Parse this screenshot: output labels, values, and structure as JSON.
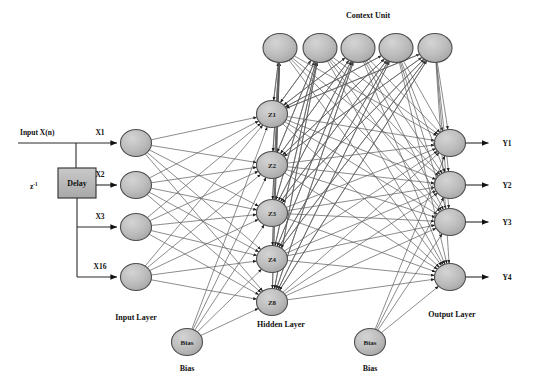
{
  "figure": {
    "background_color": "#ffffff",
    "node_fill": "#b6b6b6",
    "node_stroke": "#4d4d4d",
    "edge_color": "#5a5a5a",
    "text_color": "#111111"
  },
  "captions": {
    "context_unit": "Context Unit",
    "input_layer": "Input Layer",
    "hidden_layer": "Hidden Layer",
    "output_layer": "Output Layer",
    "bias_left": "Bias",
    "bias_right": "Bias"
  },
  "input_signal": {
    "source_label": "Input X(n)",
    "delay_label": "Delay",
    "delay_operator": "z",
    "delay_exponent": "-1"
  },
  "layers": {
    "input": {
      "count": 4,
      "nodes": [
        {
          "label": "",
          "signal_label": "X1",
          "cx": 136,
          "cy": 143
        },
        {
          "label": "",
          "signal_label": "X2",
          "cx": 136,
          "cy": 185
        },
        {
          "label": "",
          "signal_label": "X3",
          "cx": 136,
          "cy": 227
        },
        {
          "label": "",
          "signal_label": "X16",
          "cx": 136,
          "cy": 277
        }
      ]
    },
    "hidden": {
      "count": 5,
      "nodes": [
        {
          "label": "Z1",
          "cx": 272,
          "cy": 114
        },
        {
          "label": "Z2",
          "cx": 272,
          "cy": 165
        },
        {
          "label": "Z3",
          "cx": 272,
          "cy": 213
        },
        {
          "label": "Z4",
          "cx": 272,
          "cy": 259
        },
        {
          "label": "Z8",
          "cx": 272,
          "cy": 302
        }
      ]
    },
    "context": {
      "count": 5,
      "nodes": [
        {
          "label": "",
          "cx": 280,
          "cy": 48
        },
        {
          "label": "",
          "cx": 320,
          "cy": 48
        },
        {
          "label": "",
          "cx": 358,
          "cy": 48
        },
        {
          "label": "",
          "cx": 396,
          "cy": 48
        },
        {
          "label": "",
          "cx": 435,
          "cy": 48
        }
      ]
    },
    "output": {
      "count": 4,
      "nodes": [
        {
          "label": "",
          "signal_label": "Y1",
          "cx": 450,
          "cy": 143
        },
        {
          "label": "",
          "signal_label": "Y2",
          "cx": 450,
          "cy": 185
        },
        {
          "label": "",
          "signal_label": "Y3",
          "cx": 450,
          "cy": 222
        },
        {
          "label": "",
          "signal_label": "Y4",
          "cx": 450,
          "cy": 277
        }
      ]
    },
    "bias": {
      "count": 2,
      "nodes": [
        {
          "label": "Bias",
          "cx": 187,
          "cy": 342
        },
        {
          "label": "Bias",
          "cx": 370,
          "cy": 342
        }
      ]
    }
  }
}
